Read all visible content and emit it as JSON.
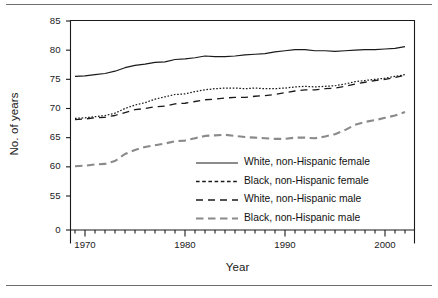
{
  "chart_data": {
    "type": "line",
    "title": "",
    "xlabel": "Year",
    "ylabel": "No. of years",
    "xlim": [
      1969,
      2002
    ],
    "ylim": [
      53.5,
      85
    ],
    "yaxis_break": true,
    "ytick_labels": [
      "85",
      "80",
      "75",
      "70",
      "65",
      "60",
      "55",
      "0"
    ],
    "ytick_values": [
      85,
      80,
      75,
      70,
      65,
      60,
      55,
      0
    ],
    "xtick_labels": [
      "1970",
      "1980",
      "1990",
      "2000"
    ],
    "xtick_values": [
      1970,
      1980,
      1990,
      2000
    ],
    "xtick_minor_step": 1,
    "grid": false,
    "legend_position": "inside-center-right",
    "x": [
      1969,
      1970,
      1971,
      1972,
      1973,
      1974,
      1975,
      1976,
      1977,
      1978,
      1979,
      1980,
      1981,
      1982,
      1983,
      1984,
      1985,
      1986,
      1987,
      1988,
      1989,
      1990,
      1991,
      1992,
      1993,
      1994,
      1995,
      1996,
      1997,
      1998,
      1999,
      2000,
      2001,
      2002
    ],
    "series": [
      {
        "name": "White, non-Hispanic female",
        "style": "solid",
        "color": "#1a1a1a",
        "values": [
          75.5,
          75.6,
          75.8,
          76.0,
          76.4,
          77.0,
          77.4,
          77.6,
          77.9,
          78.0,
          78.4,
          78.5,
          78.7,
          79.0,
          78.9,
          78.9,
          79.0,
          79.2,
          79.3,
          79.4,
          79.7,
          79.9,
          80.1,
          80.1,
          79.9,
          79.9,
          79.8,
          79.9,
          80.0,
          80.1,
          80.1,
          80.2,
          80.3,
          80.6
        ]
      },
      {
        "name": "Black, non-Hispanic female",
        "style": "dotted",
        "color": "#1a1a1a",
        "values": [
          68.3,
          68.4,
          68.6,
          68.8,
          69.2,
          70.0,
          70.6,
          71.0,
          71.6,
          72.0,
          72.4,
          72.5,
          72.9,
          73.2,
          73.4,
          73.5,
          73.5,
          73.4,
          73.5,
          73.4,
          73.4,
          73.5,
          73.7,
          73.8,
          73.7,
          73.8,
          73.9,
          74.2,
          74.6,
          74.8,
          75.0,
          75.2,
          75.5,
          75.8
        ]
      },
      {
        "name": "White, non-Hispanic male",
        "style": "dashed-long",
        "color": "#1a1a1a",
        "values": [
          68.1,
          68.2,
          68.4,
          68.5,
          68.8,
          69.3,
          69.8,
          70.0,
          70.3,
          70.4,
          70.8,
          70.9,
          71.2,
          71.5,
          71.6,
          71.8,
          71.9,
          71.9,
          72.1,
          72.2,
          72.4,
          72.7,
          73.0,
          73.2,
          73.2,
          73.4,
          73.5,
          73.8,
          74.2,
          74.5,
          74.8,
          75.0,
          75.3,
          75.7
        ]
      },
      {
        "name": "Black, non-Hispanic male",
        "style": "dashed-gray",
        "color": "#8a8a8a",
        "values": [
          60.1,
          60.2,
          60.4,
          60.5,
          61.0,
          62.2,
          62.9,
          63.4,
          63.7,
          64.0,
          64.4,
          64.5,
          64.9,
          65.3,
          65.4,
          65.5,
          65.3,
          65.1,
          65.0,
          64.9,
          64.8,
          64.8,
          65.0,
          65.0,
          64.9,
          65.2,
          65.6,
          66.3,
          67.2,
          67.7,
          68.0,
          68.4,
          68.8,
          69.4
        ]
      }
    ],
    "legend_entries": [
      {
        "label": "White, non-Hispanic female",
        "style": "solid",
        "color": "#1a1a1a"
      },
      {
        "label": "Black, non-Hispanic female",
        "style": "dashed-short",
        "color": "#1a1a1a"
      },
      {
        "label": "White, non-Hispanic male",
        "style": "dashed-long",
        "color": "#1a1a1a"
      },
      {
        "label": "Black, non-Hispanic male",
        "style": "dashed-gray",
        "color": "#8a8a8a"
      }
    ]
  }
}
